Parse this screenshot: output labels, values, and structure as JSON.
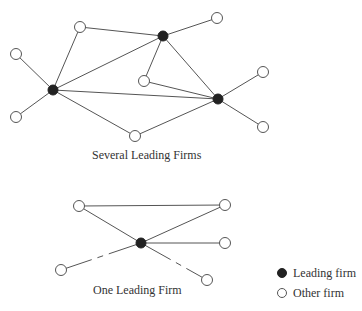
{
  "diagrams": [
    {
      "caption": "Several Leading Firms",
      "nodes": [
        {
          "id": "L1",
          "type": "leading",
          "x": 53,
          "y": 90
        },
        {
          "id": "L2",
          "type": "leading",
          "x": 163,
          "y": 36
        },
        {
          "id": "L3",
          "type": "leading",
          "x": 218,
          "y": 99
        },
        {
          "id": "O1",
          "type": "other",
          "x": 80,
          "y": 27
        },
        {
          "id": "O2",
          "type": "other",
          "x": 16,
          "y": 54
        },
        {
          "id": "O3",
          "type": "other",
          "x": 16,
          "y": 117
        },
        {
          "id": "O4",
          "type": "other",
          "x": 135,
          "y": 136
        },
        {
          "id": "O5",
          "type": "other",
          "x": 144,
          "y": 81
        },
        {
          "id": "O6",
          "type": "other",
          "x": 217,
          "y": 18
        },
        {
          "id": "O7",
          "type": "other",
          "x": 263,
          "y": 72
        },
        {
          "id": "O8",
          "type": "other",
          "x": 263,
          "y": 127
        }
      ],
      "edges": [
        [
          "L1",
          "O1"
        ],
        [
          "L1",
          "O2"
        ],
        [
          "L1",
          "O3"
        ],
        [
          "L1",
          "O4"
        ],
        [
          "L1",
          "L2"
        ],
        [
          "L1",
          "L3"
        ],
        [
          "O1",
          "L2"
        ],
        [
          "L2",
          "O6"
        ],
        [
          "L2",
          "O5"
        ],
        [
          "L2",
          "L3"
        ],
        [
          "O5",
          "L3"
        ],
        [
          "O4",
          "L3"
        ],
        [
          "L3",
          "O7"
        ],
        [
          "L3",
          "O8"
        ]
      ]
    },
    {
      "caption": "One Leading Firm",
      "nodes": [
        {
          "id": "L",
          "type": "leading",
          "x": 141,
          "y": 243
        },
        {
          "id": "A",
          "type": "other",
          "x": 79,
          "y": 206
        },
        {
          "id": "B",
          "type": "other",
          "x": 225,
          "y": 205
        },
        {
          "id": "C",
          "type": "other",
          "x": 225,
          "y": 243
        },
        {
          "id": "D",
          "type": "other",
          "x": 61,
          "y": 270
        },
        {
          "id": "E",
          "type": "other",
          "x": 207,
          "y": 280
        }
      ],
      "edges": [
        [
          "A",
          "B"
        ],
        [
          "A",
          "L"
        ],
        [
          "L",
          "B"
        ],
        [
          "L",
          "C"
        ]
      ],
      "dashed_edges": [
        [
          "L",
          "D"
        ],
        [
          "L",
          "E"
        ]
      ]
    }
  ],
  "legend": {
    "items": [
      {
        "symbol": "filled-circle",
        "label": "Leading firm"
      },
      {
        "symbol": "open-circle",
        "label": "Other firm"
      }
    ]
  }
}
